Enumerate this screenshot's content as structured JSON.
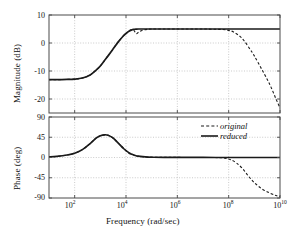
{
  "chart_data": {
    "type": "line",
    "title": "",
    "subtitle": "",
    "xlabel": "Frequency  (rad/sec)",
    "xscale": "log",
    "xlim": [
      10,
      10000000000
    ],
    "xticks": [
      100,
      10000,
      1000000,
      100000000,
      10000000000
    ],
    "xtick_labels": [
      "10²",
      "10⁴",
      "10⁶",
      "10⁸",
      "10¹⁰"
    ],
    "grid": true,
    "legend_position": "upper-right-of-lower-panel",
    "panels": [
      {
        "name": "magnitude",
        "ylabel": "Magnitude (dB)",
        "ylim": [
          -25,
          10
        ],
        "yticks": [
          10,
          0,
          -10,
          -20
        ],
        "ytick_labels": [
          "10",
          "0",
          "-10",
          "-20"
        ],
        "series": [
          {
            "name": "original",
            "style": "dashed",
            "color": "#1a1a1a",
            "x": [
              10,
              20,
              50,
              100,
              200,
              400,
              700,
              1000,
              1500,
              2000,
              3000,
              5000,
              8000,
              10000,
              13000,
              16000,
              20000,
              25000,
              32000,
              45000,
              70000,
              100000,
              300000,
              1000000,
              3000000,
              10000000,
              30000000,
              60000000,
              100000000,
              150000000,
              250000000,
              400000000,
              700000000,
              1000000000,
              2000000000,
              4000000000,
              7000000000,
              10000000000
            ],
            "y": [
              -13.1,
              -13.1,
              -13.0,
              -12.9,
              -12.5,
              -11.4,
              -9.6,
              -8.2,
              -6.1,
              -4.6,
              -2.4,
              0.4,
              2.6,
              3.4,
              4.2,
              4.7,
              4.6,
              3.3,
              4.0,
              4.6,
              4.9,
              5.0,
              5.0,
              5.0,
              5.0,
              5.0,
              4.9,
              4.8,
              4.5,
              4.0,
              2.7,
              0.8,
              -2.4,
              -4.6,
              -9.6,
              -14.8,
              -20.0,
              -23.2
            ]
          },
          {
            "name": "reduced",
            "style": "solid",
            "color": "#1a1a1a",
            "x": [
              10,
              20,
              50,
              100,
              200,
              400,
              700,
              1000,
              1500,
              2000,
              3000,
              5000,
              8000,
              10000,
              13000,
              16000,
              20000,
              25000,
              32000,
              45000,
              70000,
              100000,
              300000,
              1000000,
              10000000,
              100000000,
              1000000000,
              10000000000
            ],
            "y": [
              -13.1,
              -13.1,
              -13.0,
              -12.9,
              -12.5,
              -11.4,
              -9.6,
              -8.2,
              -6.1,
              -4.6,
              -2.4,
              0.4,
              2.6,
              3.4,
              4.2,
              4.6,
              4.85,
              4.95,
              5.0,
              5.0,
              5.0,
              5.0,
              5.0,
              5.0,
              5.0,
              5.0,
              5.0,
              5.0
            ]
          }
        ]
      },
      {
        "name": "phase",
        "ylabel": "Phase (deg)",
        "ylim": [
          -90,
          90
        ],
        "yticks": [
          90,
          45,
          0,
          -45,
          -90
        ],
        "ytick_labels": [
          "90",
          "45",
          "0",
          "-45",
          "-90"
        ],
        "series": [
          {
            "name": "original",
            "style": "dashed",
            "color": "#1a1a1a",
            "x": [
              10,
              20,
              50,
              100,
              200,
              400,
              700,
              1000,
              1500,
              2000,
              3000,
              5000,
              8000,
              11000,
              14000,
              18000,
              23000,
              30000,
              45000,
              70000,
              120000,
              300000,
              1000000,
              5000000,
              20000000,
              50000000,
              80000000,
              120000000,
              200000000,
              350000000,
              600000000,
              1000000000,
              2000000000,
              4000000000,
              7000000000,
              10000000000
            ],
            "y": [
              1.5,
              2.5,
              5.5,
              9.5,
              17.5,
              31.0,
              43.5,
              48.5,
              50.5,
              49.5,
              44.0,
              32.0,
              20.5,
              13.0,
              8.5,
              7.0,
              3.5,
              2.5,
              1.5,
              1.0,
              0.6,
              0.3,
              0.2,
              0.1,
              0.0,
              -0.5,
              -2.0,
              -5.0,
              -12.0,
              -25.0,
              -42.0,
              -56.0,
              -70.0,
              -79.0,
              -84.5,
              -87.0
            ]
          },
          {
            "name": "reduced",
            "style": "solid",
            "color": "#1a1a1a",
            "x": [
              10,
              20,
              50,
              100,
              200,
              400,
              700,
              1000,
              1500,
              2000,
              3000,
              5000,
              8000,
              11000,
              14000,
              18000,
              23000,
              30000,
              45000,
              70000,
              120000,
              300000,
              1000000,
              10000000,
              100000000,
              1000000000,
              10000000000
            ],
            "y": [
              1.5,
              2.5,
              5.5,
              9.5,
              17.5,
              31.0,
              43.5,
              48.5,
              50.5,
              49.5,
              44.0,
              32.0,
              20.0,
              13.5,
              9.5,
              6.5,
              4.5,
              3.0,
              1.8,
              1.0,
              0.6,
              0.3,
              0.2,
              0.1,
              0.0,
              0.0,
              0.0
            ]
          }
        ]
      }
    ],
    "legend": [
      {
        "label": "original",
        "style": "dashed"
      },
      {
        "label": "reduced",
        "style": "solid"
      }
    ]
  },
  "axes": {
    "magnitude_ylabel": "Magnitude (dB)",
    "phase_ylabel": "Phase (deg)",
    "xlabel": "Frequency  (rad/sec)"
  },
  "mag_ticks": {
    "t0": "10",
    "t1": "0",
    "t2": "-10",
    "t3": "-20"
  },
  "phase_ticks": {
    "t0": "90",
    "t1": "45",
    "t2": "0",
    "t3": "-45",
    "t4": "-90"
  },
  "xticks": {
    "t0": "10",
    "t0e": "2",
    "t1": "10",
    "t1e": "4",
    "t2": "10",
    "t2e": "6",
    "t3": "10",
    "t3e": "8",
    "t4": "10",
    "t4e": "10"
  },
  "legend": {
    "original": "original",
    "reduced": "reduced"
  },
  "colors": {
    "curve": "#1a1a1a",
    "grid": "#b4b4b4",
    "frame": "#4a4a4a",
    "background": "#ffffff"
  }
}
